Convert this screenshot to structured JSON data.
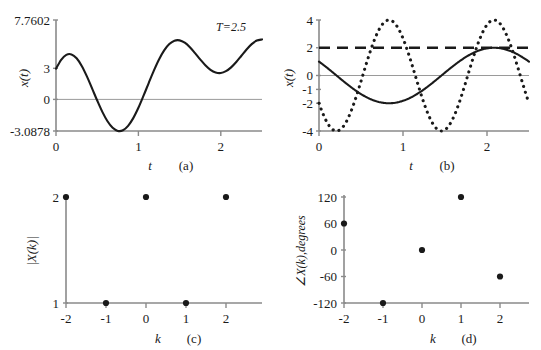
{
  "figure": {
    "background": "#ffffff",
    "ink": "#1a1a1a",
    "axis_gray": "#8a8a8a"
  },
  "panels": [
    {
      "id": "a",
      "caption": "(a)",
      "xlabel": "t",
      "ylabel": "x(t)",
      "annotation": "T=2.5",
      "ytick_labels": [
        "7.7602",
        "3",
        "0",
        "-3.0878"
      ],
      "ytick_values": [
        7.7602,
        3,
        0,
        -3.0878
      ],
      "xtick_labels": [
        "0",
        "1",
        "2"
      ],
      "xtick_values": [
        0,
        1,
        2
      ]
    },
    {
      "id": "b",
      "caption": "(b)",
      "xlabel": "t",
      "ylabel": "x(t)",
      "ytick_labels": [
        "4",
        "2",
        "0",
        "-1",
        "-2",
        "-4"
      ],
      "ytick_values": [
        4,
        2,
        0,
        -1,
        -2,
        -4
      ],
      "xtick_labels": [
        "0",
        "1",
        "2"
      ],
      "xtick_values": [
        0,
        1,
        2
      ]
    },
    {
      "id": "c",
      "caption": "(c)",
      "xlabel": "k",
      "ylabel": "|X(k)|",
      "ytick_labels": [
        "2",
        "1"
      ],
      "ytick_values": [
        2,
        1
      ],
      "xtick_labels": [
        "-2",
        "-1",
        "0",
        "1",
        "2"
      ],
      "xtick_values": [
        -2,
        -1,
        0,
        1,
        2
      ]
    },
    {
      "id": "d",
      "caption": "(d)",
      "xlabel": "k",
      "ylabel": "∠X(k),degrees",
      "ytick_labels": [
        "120",
        "60",
        "0",
        "-60",
        "-120"
      ],
      "ytick_values": [
        120,
        60,
        0,
        -60,
        -120
      ],
      "xtick_labels": [
        "-2",
        "-1",
        "0",
        "1",
        "2"
      ],
      "xtick_values": [
        -2,
        -1,
        0,
        1,
        2
      ]
    }
  ],
  "chart_data": [
    {
      "type": "line",
      "panel": "a",
      "title": "",
      "xlabel": "t",
      "ylabel": "x(t)",
      "xlim": [
        0,
        2.5
      ],
      "ylim": [
        -3.0878,
        7.7602
      ],
      "grid": false,
      "legend": "none",
      "annotations": [
        "T=2.5"
      ],
      "series": [
        {
          "name": "x(t) = 2 + 4cos(2πt/2.5 + 60°) + 4cos(4πt/2.5 + 120°)",
          "style": "solid",
          "color": "#1a1a1a",
          "x": [
            0,
            0.0625,
            0.125,
            0.1875,
            0.25,
            0.3125,
            0.375,
            0.4375,
            0.5,
            0.5625,
            0.625,
            0.6875,
            0.75,
            0.8125,
            0.875,
            0.9375,
            1,
            1.0625,
            1.125,
            1.1875,
            1.25,
            1.3125,
            1.375,
            1.4375,
            1.5,
            1.5625,
            1.625,
            1.6875,
            1.75,
            1.8125,
            1.875,
            1.9375,
            2,
            2.0625,
            2.125,
            2.1875,
            2.25,
            2.3125,
            2.375,
            2.4375,
            2.5
          ],
          "y": [
            3.0,
            3.86,
            4.35,
            4.4,
            4.02,
            3.27,
            2.25,
            1.08,
            -0.11,
            -1.22,
            -2.14,
            -2.78,
            -3.08,
            -3.02,
            -2.59,
            -1.83,
            -0.82,
            0.36,
            1.6,
            2.81,
            3.9,
            4.79,
            5.41,
            5.74,
            5.77,
            5.54,
            5.1,
            4.52,
            3.91,
            3.34,
            2.89,
            2.63,
            2.58,
            2.76,
            3.13,
            3.66,
            4.27,
            4.88,
            5.4,
            5.75,
            5.86
          ]
        }
      ],
      "notes": "Curve starts at 3 at t=0, local max ~4.4 near t=0.19, minimum -3.0878 near t=0.79, global maximum 7.7602 near t=1.5, local minimum ~-1 near t=2.15, returns toward 3 at t=2.5"
    },
    {
      "type": "line",
      "panel": "b",
      "title": "",
      "xlabel": "t",
      "ylabel": "x(t)",
      "xlim": [
        0,
        2.5
      ],
      "ylim": [
        -4,
        4
      ],
      "grid": false,
      "legend": "none",
      "series": [
        {
          "name": "DC component = 2",
          "style": "dashed",
          "color": "#1a1a1a",
          "constant": 2
        },
        {
          "name": "second harmonic, amplitude 4",
          "style": "dotted",
          "color": "#1a1a1a",
          "amplitude": 4,
          "cycles": 2,
          "phase_deg": 120,
          "start_value": 2
        },
        {
          "name": "fundamental, amplitude 2",
          "style": "solid",
          "color": "#1a1a1a",
          "amplitude": 2,
          "cycles": 1,
          "phase_deg": 60,
          "start_value": -1
        }
      ]
    },
    {
      "type": "scatter",
      "panel": "c",
      "title": "",
      "xlabel": "k",
      "ylabel": "|X(k)|",
      "xlim": [
        -2.6,
        2.9
      ],
      "ylim": [
        1,
        2
      ],
      "grid": false,
      "legend": "none",
      "x": [
        -2,
        -1,
        0,
        1,
        2
      ],
      "values": [
        2,
        1,
        2,
        1,
        2
      ]
    },
    {
      "type": "scatter",
      "panel": "d",
      "title": "",
      "xlabel": "k",
      "ylabel": "∠X(k),degrees",
      "xlim": [
        -2.6,
        2.9
      ],
      "ylim": [
        -120,
        120
      ],
      "grid": false,
      "legend": "none",
      "x": [
        -2,
        -1,
        0,
        1,
        2
      ],
      "values": [
        60,
        -120,
        0,
        120,
        -60
      ]
    }
  ]
}
